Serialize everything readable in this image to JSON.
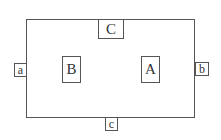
{
  "diagram": {
    "boxes": {
      "top": "C",
      "left_inner": "B",
      "right_inner": "A",
      "left_edge": "a",
      "right_edge": "b",
      "bottom_edge": "c"
    }
  }
}
